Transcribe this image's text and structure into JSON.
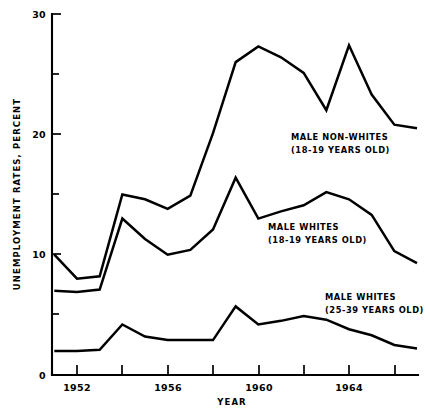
{
  "chart_data": {
    "type": "line",
    "title": "",
    "xlabel": "YEAR",
    "ylabel": "UNEMPLOYMENT RATES, PERCENT",
    "xlim": [
      1951,
      1967
    ],
    "ylim": [
      0,
      30
    ],
    "grid": false,
    "legend_position": "inline-annotations",
    "x_major_ticks": [
      1952,
      1956,
      1960,
      1964
    ],
    "x_major_tick_labels": [
      "1952",
      "1956",
      "1960",
      "1964"
    ],
    "x_all_ticks": [
      1952,
      1954,
      1956,
      1958,
      1960,
      1962,
      1964,
      1966
    ],
    "y_major_ticks": [
      0,
      10,
      20,
      30
    ],
    "y_major_tick_labels": [
      "0",
      "10",
      "20",
      "30"
    ],
    "y_minor_ticks": [
      5,
      15,
      25
    ],
    "x": [
      1951,
      1952,
      1953,
      1954,
      1955,
      1956,
      1957,
      1958,
      1959,
      1960,
      1961,
      1962,
      1963,
      1964,
      1965,
      1966,
      1967
    ],
    "series": [
      {
        "name": "MALE NON-WHITES (18-19 YEARS OLD)",
        "label_line1": "MALE NON-WHITES",
        "label_line2": "(18-19 YEARS OLD)",
        "color": "#000000",
        "values": [
          10.0,
          8.0,
          8.2,
          15.0,
          14.6,
          13.8,
          14.9,
          20.1,
          26.0,
          27.3,
          26.4,
          25.1,
          22.0,
          27.4,
          23.3,
          20.8,
          20.5
        ]
      },
      {
        "name": "MALE WHITES (18-19 YEARS OLD)",
        "label_line1": "MALE WHITES",
        "label_line2": "(18-19 YEARS OLD)",
        "color": "#000000",
        "values": [
          7.0,
          6.9,
          7.1,
          13.0,
          11.3,
          10.0,
          10.4,
          12.1,
          16.4,
          13.0,
          13.6,
          14.1,
          15.2,
          14.6,
          13.3,
          10.3,
          9.3
        ]
      },
      {
        "name": "MALE WHITES (25-39 YEARS OLD)",
        "label_line1": "MALE WHITES",
        "label_line2": "(25-39 YEARS OLD)",
        "color": "#000000",
        "values": [
          2.0,
          2.0,
          2.1,
          4.2,
          3.2,
          2.9,
          2.9,
          2.9,
          5.7,
          4.2,
          4.5,
          4.9,
          4.6,
          3.8,
          3.3,
          2.5,
          2.2
        ]
      }
    ]
  },
  "annotations": {
    "nonwhites": {
      "line1": "MALE NON-WHITES",
      "line2": "(18-19 YEARS OLD)"
    },
    "whites1819": {
      "line1": "MALE WHITES",
      "line2": "(18-19 YEARS OLD)"
    },
    "whites2539": {
      "line1": "MALE WHITES",
      "line2": "(25-39 YEARS OLD)"
    }
  },
  "axes": {
    "y_title": "UNEMPLOYMENT RATES, PERCENT",
    "x_title": "YEAR",
    "y_labels": {
      "t0": "0",
      "t10": "10",
      "t20": "20",
      "t30": "30"
    },
    "x_labels": {
      "t1952": "1952",
      "t1956": "1956",
      "t1960": "1960",
      "t1964": "1964"
    }
  }
}
